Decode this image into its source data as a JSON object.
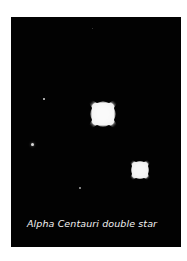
{
  "image": {
    "caption": "Alpha Centauri double star",
    "background_color": "#020202",
    "page_color": "#ffffff"
  },
  "stars": [
    {
      "name": "alpha-centauri-a",
      "size": "large",
      "cx": 103,
      "cy": 114
    },
    {
      "name": "alpha-centauri-b",
      "size": "medium",
      "cx": 140,
      "cy": 170
    },
    {
      "name": "faint-star-1",
      "size": "tiny",
      "cx": 44,
      "cy": 99
    },
    {
      "name": "faint-star-2",
      "size": "tiny",
      "cx": 32,
      "cy": 144
    },
    {
      "name": "faint-star-3",
      "size": "tiny",
      "cx": 79,
      "cy": 188
    },
    {
      "name": "faint-star-4",
      "size": "tiny",
      "cx": 92,
      "cy": 28
    }
  ]
}
